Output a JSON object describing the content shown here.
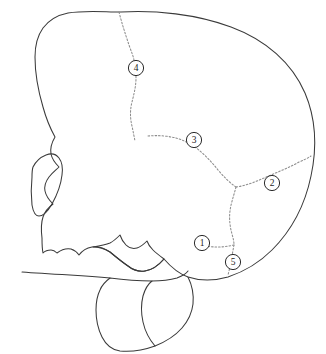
{
  "figure": {
    "width": 326,
    "height": 354,
    "background_color": "#ffffff",
    "outline_color": "#3a3a3a",
    "suture_color": "#8d8d8d",
    "callout_border_color": "#2b2b2b",
    "callout_fill_color": "#ffffff",
    "callout_text_color": "#1c1c1c"
  },
  "callouts": [
    {
      "id": "callout-1",
      "label": "1",
      "cx": 202,
      "cy": 243,
      "r": 7.6,
      "anatomy": "parietomastoid / asterion region"
    },
    {
      "id": "callout-2",
      "label": "2",
      "cx": 272,
      "cy": 183,
      "r": 7.6,
      "anatomy": "lambdoid suture"
    },
    {
      "id": "callout-3",
      "label": "3",
      "cx": 194,
      "cy": 140,
      "r": 7.6,
      "anatomy": "squamous suture"
    },
    {
      "id": "callout-4",
      "label": "4",
      "cx": 136,
      "cy": 68,
      "r": 7.6,
      "anatomy": "coronal suture"
    },
    {
      "id": "callout-5",
      "label": "5",
      "cx": 233,
      "cy": 262,
      "r": 7.6,
      "anatomy": "occipitomastoid suture"
    }
  ],
  "outlines": [
    {
      "id": "cranium-and-face",
      "name": "cranium-face-profile",
      "d": "M 121 12 C 155 10 196 14 231 27 C 266 40 292 63 305 93 C 316 119 317 148 311 176 C 305 205 291 231 272 250 C 258 264 243 272 228 277 C 214 281 200 281 188 277 C 177 273 170 266 164 259 C 158 266 152 270 145 271 C 139 272 133 270 128 266 C 122 262 116 257 110 252 C 104 248 98 246 92 247 C 86 248 82 251 79 255 C 77 252 74 250 71 249 C 66 248 61 250 57 253 C 55 251 53 250 51 250 C 48 250 45 251 43 253 C 42 248 42 243 42 238 C 41 230 41 223 43 217 C 45 211 49 207 53 204 C 49 200 46 196 45 191 C 44 186 46 181 49 177 C 52 173 56 170 59 167 C 55 163 52 159 51 154 C 50 148 52 142 55 137 C 50 128 46 118 43 107 C 38 90 35 72 35 57 C 35 45 38 35 43 28 C 49 20 58 15 68 13 C 85 10 104 12 121 12 Z"
    },
    {
      "id": "orbit-nasal",
      "name": "orbit-nasal-aperture",
      "d": "M 33 167 C 36 161 41 157 46 155 C 51 153 56 154 59 158 C 62 162 63 168 62 175 C 61 184 57 195 52 204 C 48 211 43 216 39 216 C 35 216 33 211 32 205 C 31 196 31 186 32 177 C 32 173 32 170 33 167 Z"
    },
    {
      "id": "maxilla-edge",
      "name": "maxilla-lower-edge",
      "d": "M 22 272 C 35 273 52 274 70 275 C 87 276 100 277 110 278"
    },
    {
      "id": "mandible-body",
      "name": "mandible-outline",
      "d": "M 110 278 C 106 281 102 285 100 290 C 97 296 96 303 96 310 C 96 319 98 329 102 337 C 106 345 112 350 120 351 C 131 352 144 350 155 346 C 149 339 145 331 143 322 C 141 313 141 304 143 296 C 145 289 148 284 152 281 C 140 281 125 280 110 278 Z"
    },
    {
      "id": "mandible-ramus",
      "name": "mandible-ramus-condyle",
      "d": "M 93 247 C 99 247 105 249 110 252 C 116 257 122 262 128 266 C 133 270 139 272 145 271 C 152 270 158 266 164 259 C 160 256 156 253 153 250 C 150 247 148 244 147 241 C 144 244 141 247 137 248 C 133 249 129 248 126 245 C 123 242 121 238 120 235 C 117 238 114 241 110 243 C 105 245 99 246 93 247 Z"
    },
    {
      "id": "mandible-inner-lower",
      "name": "mandible-inner-contour",
      "d": "M 155 346 C 165 342 175 336 182 328 C 188 321 192 313 193 304 C 194 294 192 285 188 277"
    },
    {
      "id": "gonial-notch",
      "name": "gonial-angle-contour",
      "d": "M 152 281 C 161 281 170 280 177 278 C 182 276 186 274 188 271"
    }
  ],
  "sutures": [
    {
      "id": "coronal-suture",
      "name": "coronal-suture",
      "d": "M 119 12 C 122 24 126 36 129 45 C 131 51 133 55 134 60 C 135 66 136 72 136 78 C 136 86 134 94 132 102 C 130 110 130 118 132 126 C 133 131 134 136 135 141"
    },
    {
      "id": "squamous-suture",
      "name": "squamous-suture",
      "d": "M 148 136 C 158 135 168 136 176 138 C 183 140 189 143 195 147 C 203 153 211 161 218 170 C 224 177 230 183 236 187"
    },
    {
      "id": "lambdoid-suture",
      "name": "lambdoid-suture",
      "d": "M 236 187 C 243 186 250 184 257 181 C 264 178 271 175 278 172 C 285 169 292 166 299 162 C 304 160 308 158 311 156"
    },
    {
      "id": "parietomastoid-suture",
      "name": "parietomastoid-descending-suture",
      "d": "M 236 187 C 234 195 231 203 230 211 C 229 219 230 227 232 234 C 233 238 234 241 234 245"
    },
    {
      "id": "asterion-branch",
      "name": "asterion-branch-suture",
      "d": "M 234 245 C 229 246 224 247 219 247 C 215 247 211 247 208 246"
    },
    {
      "id": "occipitomastoid-suture",
      "name": "occipitomastoid-suture",
      "d": "M 234 245 C 233 250 232 256 231 262 C 230 267 229 271 228 275"
    }
  ]
}
